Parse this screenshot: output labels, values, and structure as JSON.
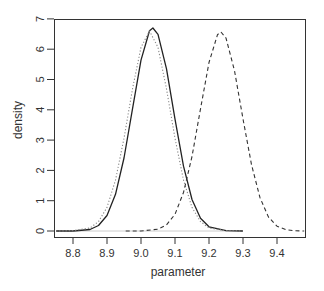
{
  "chart_data": {
    "type": "line",
    "title": "",
    "xlabel": "parameter",
    "ylabel": "density",
    "xlim": [
      8.75,
      9.48
    ],
    "ylim": [
      0,
      7
    ],
    "x_ticks": [
      8.8,
      8.9,
      9.0,
      9.1,
      9.2,
      9.3,
      9.4
    ],
    "x_tick_labels": [
      "8.8",
      "8.9",
      "9.0",
      "9.1",
      "9.2",
      "9.3",
      "9.4"
    ],
    "y_ticks": [
      0,
      1,
      2,
      3,
      4,
      5,
      6,
      7
    ],
    "y_tick_labels": [
      "0",
      "1",
      "2",
      "3",
      "4",
      "5",
      "6",
      "7"
    ],
    "grid": false,
    "legend": null,
    "baseline": {
      "y": 0,
      "x_from": 8.75,
      "x_to": 9.3,
      "color": "#cccccc"
    },
    "series": [
      {
        "name": "solid",
        "style": "solid",
        "color": "#222222",
        "x": [
          8.75,
          8.8,
          8.85,
          8.875,
          8.9,
          8.925,
          8.95,
          8.975,
          9.0,
          9.025,
          9.035,
          9.05,
          9.075,
          9.1,
          9.125,
          9.15,
          9.175,
          9.2,
          9.25,
          9.3
        ],
        "y": [
          0.0,
          0.0,
          0.05,
          0.18,
          0.51,
          1.21,
          2.41,
          4.03,
          5.64,
          6.61,
          6.7,
          6.49,
          5.35,
          3.69,
          2.14,
          1.04,
          0.42,
          0.14,
          0.01,
          0.0
        ]
      },
      {
        "name": "dotted",
        "style": "dotted",
        "color": "#888888",
        "x": [
          8.75,
          8.8,
          8.85,
          8.875,
          8.9,
          8.925,
          8.95,
          8.975,
          9.0,
          9.025,
          9.05,
          9.075,
          9.1,
          9.125,
          9.15,
          9.175,
          9.2,
          9.25,
          9.3
        ],
        "y": [
          0.0,
          0.01,
          0.1,
          0.31,
          0.78,
          1.68,
          3.06,
          4.69,
          6.06,
          6.6,
          6.06,
          4.69,
          3.06,
          1.68,
          0.78,
          0.31,
          0.1,
          0.01,
          0.0
        ]
      },
      {
        "name": "dashed",
        "style": "dashed",
        "color": "#333333",
        "x": [
          8.955,
          9.0,
          9.05,
          9.075,
          9.1,
          9.125,
          9.15,
          9.175,
          9.2,
          9.225,
          9.235,
          9.25,
          9.275,
          9.3,
          9.325,
          9.35,
          9.375,
          9.4,
          9.425,
          9.45,
          9.48
        ],
        "y": [
          0.0,
          0.0,
          0.06,
          0.2,
          0.55,
          1.27,
          2.46,
          4.03,
          5.56,
          6.48,
          6.57,
          6.37,
          5.29,
          3.7,
          2.19,
          1.1,
          0.46,
          0.16,
          0.05,
          0.01,
          0.0
        ]
      }
    ]
  }
}
